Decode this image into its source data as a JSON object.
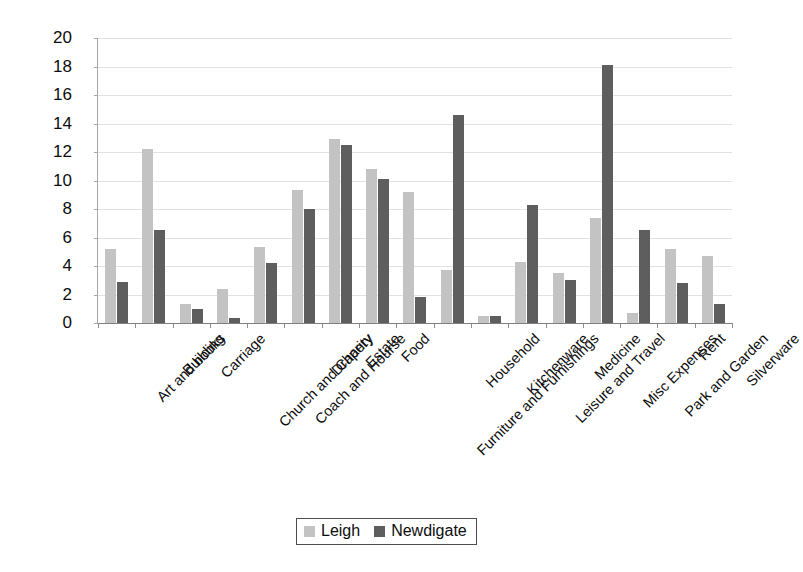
{
  "chart_data": {
    "type": "bar",
    "title": "",
    "xlabel": "",
    "ylabel": "",
    "ylim": [
      0,
      20
    ],
    "ytick_step": 2,
    "yticks": [
      20,
      18,
      16,
      14,
      12,
      10,
      8,
      6,
      4,
      2,
      0
    ],
    "grid": true,
    "legend_position": "bottom",
    "categories": [
      "Art and books",
      "Building",
      "Carriage",
      "Church and Charity",
      "Coach and Hourse",
      "Drapery",
      "Estate",
      "Food",
      "Furniture and Furnishings",
      "Household",
      "Kitchenware",
      "Leisure and Travel",
      "Medicine",
      "Misc Expenses",
      "Park and Garden",
      "Rent",
      "Silverware"
    ],
    "series": [
      {
        "name": "Leigh",
        "color": "#c3c3c3",
        "values": [
          5.2,
          12.2,
          1.3,
          2.4,
          5.3,
          9.3,
          12.9,
          10.8,
          9.2,
          3.7,
          0.5,
          4.3,
          3.5,
          7.4,
          0.7,
          5.2,
          4.7
        ]
      },
      {
        "name": "Newdigate",
        "color": "#5e5e5e",
        "values": [
          2.9,
          6.5,
          1.0,
          0.35,
          4.2,
          8.0,
          12.5,
          10.1,
          1.8,
          14.6,
          0.5,
          8.3,
          3.0,
          18.1,
          6.5,
          2.8,
          1.3
        ]
      }
    ]
  },
  "legend": {
    "items": [
      {
        "label": "Leigh",
        "swatch": "leigh"
      },
      {
        "label": "Newdigate",
        "swatch": "newdigate"
      }
    ]
  }
}
